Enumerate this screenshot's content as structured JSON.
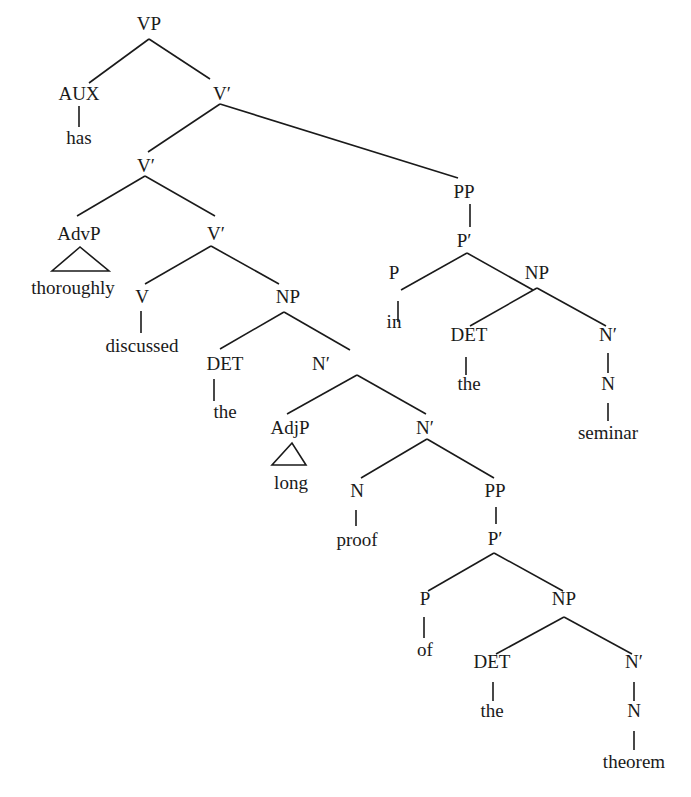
{
  "diagram": {
    "type": "syntax-tree",
    "sentence": "has thoroughly discussed the long proof of the theorem in the seminar",
    "nodes": [
      {
        "id": "vp_root",
        "label": "VP",
        "x": 149,
        "y": 26,
        "kind": "phrase"
      },
      {
        "id": "aux",
        "label": "AUX",
        "x": 79,
        "y": 96,
        "kind": "phrase"
      },
      {
        "id": "has",
        "label": "has",
        "x": 79,
        "y": 140,
        "kind": "word"
      },
      {
        "id": "vbar1",
        "label": "V′",
        "x": 222,
        "y": 96,
        "kind": "phrase"
      },
      {
        "id": "vbar2",
        "label": "V′",
        "x": 146,
        "y": 168,
        "kind": "phrase"
      },
      {
        "id": "pp1",
        "label": "PP",
        "x": 464,
        "y": 194,
        "kind": "phrase"
      },
      {
        "id": "pbar1",
        "label": "P′",
        "x": 464,
        "y": 243,
        "kind": "phrase"
      },
      {
        "id": "advp",
        "label": "AdvP",
        "x": 79,
        "y": 236,
        "kind": "phrase"
      },
      {
        "id": "thoroughly",
        "label": "thoroughly",
        "x": 73,
        "y": 290,
        "kind": "word"
      },
      {
        "id": "vbar3",
        "label": "V′",
        "x": 216,
        "y": 236,
        "kind": "phrase"
      },
      {
        "id": "v",
        "label": "V",
        "x": 142,
        "y": 299,
        "kind": "phrase"
      },
      {
        "id": "discussed",
        "label": "discussed",
        "x": 142,
        "y": 348,
        "kind": "word"
      },
      {
        "id": "np1",
        "label": "NP",
        "x": 288,
        "y": 299,
        "kind": "phrase"
      },
      {
        "id": "p1",
        "label": "P",
        "x": 394,
        "y": 275,
        "kind": "phrase"
      },
      {
        "id": "in",
        "label": "in",
        "x": 394,
        "y": 324,
        "kind": "word"
      },
      {
        "id": "np2",
        "label": "NP",
        "x": 537,
        "y": 275,
        "kind": "phrase"
      },
      {
        "id": "det1",
        "label": "DET",
        "x": 225,
        "y": 366,
        "kind": "phrase"
      },
      {
        "id": "the1",
        "label": "the",
        "x": 225,
        "y": 414,
        "kind": "word"
      },
      {
        "id": "nbar1",
        "label": "N′",
        "x": 321,
        "y": 366,
        "kind": "phrase"
      },
      {
        "id": "det2",
        "label": "DET",
        "x": 469,
        "y": 337,
        "kind": "phrase"
      },
      {
        "id": "the2",
        "label": "the",
        "x": 469,
        "y": 386,
        "kind": "word"
      },
      {
        "id": "nbar2",
        "label": "N′",
        "x": 608,
        "y": 337,
        "kind": "phrase"
      },
      {
        "id": "n2",
        "label": "N",
        "x": 608,
        "y": 386,
        "kind": "phrase"
      },
      {
        "id": "seminar",
        "label": "seminar",
        "x": 608,
        "y": 435,
        "kind": "word"
      },
      {
        "id": "adjp",
        "label": "AdjP",
        "x": 290,
        "y": 430,
        "kind": "phrase"
      },
      {
        "id": "long",
        "label": "long",
        "x": 291,
        "y": 485,
        "kind": "word"
      },
      {
        "id": "nbar3",
        "label": "N′",
        "x": 425,
        "y": 430,
        "kind": "phrase"
      },
      {
        "id": "n1",
        "label": "N",
        "x": 357,
        "y": 493,
        "kind": "phrase"
      },
      {
        "id": "proof",
        "label": "proof",
        "x": 357,
        "y": 542,
        "kind": "word"
      },
      {
        "id": "pp2",
        "label": "PP",
        "x": 495,
        "y": 493,
        "kind": "phrase"
      },
      {
        "id": "pbar2",
        "label": "P′",
        "x": 495,
        "y": 541,
        "kind": "phrase"
      },
      {
        "id": "p2",
        "label": "P",
        "x": 425,
        "y": 601,
        "kind": "phrase"
      },
      {
        "id": "of",
        "label": "of",
        "x": 425,
        "y": 652,
        "kind": "word"
      },
      {
        "id": "np3",
        "label": "NP",
        "x": 564,
        "y": 601,
        "kind": "phrase"
      },
      {
        "id": "det3",
        "label": "DET",
        "x": 492,
        "y": 664,
        "kind": "phrase"
      },
      {
        "id": "the3",
        "label": "the",
        "x": 492,
        "y": 713,
        "kind": "word"
      },
      {
        "id": "nbar4",
        "label": "N′",
        "x": 634,
        "y": 664,
        "kind": "phrase"
      },
      {
        "id": "n3",
        "label": "N",
        "x": 634,
        "y": 713,
        "kind": "phrase"
      },
      {
        "id": "theorem",
        "label": "theorem",
        "x": 634,
        "y": 764,
        "kind": "word"
      }
    ],
    "edges": [
      {
        "from": "vp_root",
        "to": "aux",
        "x1": 149,
        "y1": 39,
        "x2": 89,
        "y2": 83
      },
      {
        "from": "vp_root",
        "to": "vbar1",
        "x1": 149,
        "y1": 39,
        "x2": 210,
        "y2": 79
      },
      {
        "from": "aux",
        "to": "has",
        "x1": 79,
        "y1": 106,
        "x2": 79,
        "y2": 127
      },
      {
        "from": "vbar1",
        "to": "vbar2",
        "x1": 220,
        "y1": 104,
        "x2": 148,
        "y2": 152
      },
      {
        "from": "vbar1",
        "to": "pp1",
        "x1": 220,
        "y1": 104,
        "x2": 458,
        "y2": 178
      },
      {
        "from": "vbar2",
        "to": "advp",
        "x1": 145,
        "y1": 176,
        "x2": 77,
        "y2": 216
      },
      {
        "from": "vbar2",
        "to": "vbar3",
        "x1": 145,
        "y1": 176,
        "x2": 215,
        "y2": 216
      },
      {
        "from": "pp1",
        "to": "pbar1",
        "x1": 470,
        "y1": 204,
        "x2": 470,
        "y2": 227
      },
      {
        "from": "vbar3",
        "to": "v",
        "x1": 211,
        "y1": 246,
        "x2": 145,
        "y2": 284
      },
      {
        "from": "vbar3",
        "to": "np1",
        "x1": 211,
        "y1": 246,
        "x2": 279,
        "y2": 284
      },
      {
        "from": "v",
        "to": "discussed",
        "x1": 141,
        "y1": 311,
        "x2": 141,
        "y2": 333
      },
      {
        "from": "np1",
        "to": "det1",
        "x1": 284,
        "y1": 312,
        "x2": 220,
        "y2": 349
      },
      {
        "from": "np1",
        "to": "nbar1",
        "x1": 284,
        "y1": 312,
        "x2": 350,
        "y2": 350
      },
      {
        "from": "det1",
        "to": "the1",
        "x1": 214,
        "y1": 379,
        "x2": 214,
        "y2": 401
      },
      {
        "from": "pbar1",
        "to": "p1",
        "x1": 467,
        "y1": 253,
        "x2": 401,
        "y2": 290
      },
      {
        "from": "pbar1",
        "to": "np2",
        "x1": 467,
        "y1": 253,
        "x2": 533,
        "y2": 290
      },
      {
        "from": "p1",
        "to": "in",
        "x1": 398,
        "y1": 301,
        "x2": 398,
        "y2": 322
      },
      {
        "from": "np2",
        "to": "det2",
        "x1": 537,
        "y1": 288,
        "x2": 470,
        "y2": 326
      },
      {
        "from": "np2",
        "to": "nbar2",
        "x1": 537,
        "y1": 288,
        "x2": 606,
        "y2": 326
      },
      {
        "from": "det2",
        "to": "the2",
        "x1": 466,
        "y1": 357,
        "x2": 466,
        "y2": 375
      },
      {
        "from": "nbar2",
        "to": "n2",
        "x1": 608,
        "y1": 353,
        "x2": 608,
        "y2": 373
      },
      {
        "from": "n2",
        "to": "seminar",
        "x1": 608,
        "y1": 403,
        "x2": 608,
        "y2": 421
      },
      {
        "from": "nbar1",
        "to": "adjp",
        "x1": 357,
        "y1": 375,
        "x2": 287,
        "y2": 414
      },
      {
        "from": "nbar1",
        "to": "nbar3",
        "x1": 357,
        "y1": 375,
        "x2": 426,
        "y2": 414
      },
      {
        "from": "nbar3",
        "to": "n1",
        "x1": 427,
        "y1": 439,
        "x2": 361,
        "y2": 478
      },
      {
        "from": "nbar3",
        "to": "pp2",
        "x1": 427,
        "y1": 439,
        "x2": 494,
        "y2": 478
      },
      {
        "from": "n1",
        "to": "proof",
        "x1": 356,
        "y1": 510,
        "x2": 356,
        "y2": 526
      },
      {
        "from": "pp2",
        "to": "pbar2",
        "x1": 496,
        "y1": 507,
        "x2": 496,
        "y2": 524
      },
      {
        "from": "pbar2",
        "to": "p2",
        "x1": 494,
        "y1": 553,
        "x2": 428,
        "y2": 591
      },
      {
        "from": "pbar2",
        "to": "np3",
        "x1": 494,
        "y1": 553,
        "x2": 563,
        "y2": 591
      },
      {
        "from": "p2",
        "to": "of",
        "x1": 424,
        "y1": 617,
        "x2": 424,
        "y2": 638
      },
      {
        "from": "np3",
        "to": "det3",
        "x1": 564,
        "y1": 617,
        "x2": 496,
        "y2": 654
      },
      {
        "from": "np3",
        "to": "nbar4",
        "x1": 564,
        "y1": 617,
        "x2": 632,
        "y2": 654
      },
      {
        "from": "det3",
        "to": "the3",
        "x1": 493,
        "y1": 682,
        "x2": 493,
        "y2": 701
      },
      {
        "from": "nbar4",
        "to": "n3",
        "x1": 634,
        "y1": 682,
        "x2": 634,
        "y2": 701
      },
      {
        "from": "n3",
        "to": "theorem",
        "x1": 634,
        "y1": 731,
        "x2": 634,
        "y2": 750
      }
    ],
    "triangles": [
      {
        "for": "advp",
        "points": "80,247 52,271 109,271"
      },
      {
        "for": "adjp",
        "points": "292,443 272,465 306,465"
      }
    ]
  }
}
